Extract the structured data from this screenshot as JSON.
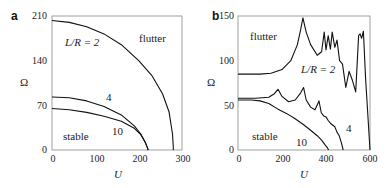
{
  "chart_data": [
    {
      "panel": "a",
      "type": "line",
      "xlabel": "U",
      "ylabel": "Ω",
      "xlim": [
        0,
        300
      ],
      "ylim": [
        0,
        210
      ],
      "xticks": [
        0,
        100,
        200,
        300
      ],
      "yticks": [
        0,
        70,
        140,
        210
      ],
      "regions": [
        "flutter",
        "stable"
      ],
      "series": [
        {
          "name": "L/R = 2",
          "label": "L/R = 2",
          "x": [
            0,
            40,
            80,
            120,
            160,
            200,
            230,
            255,
            270,
            278,
            280,
            280
          ],
          "y": [
            203,
            200,
            193,
            182,
            165,
            140,
            117,
            88,
            60,
            25,
            5,
            0
          ]
        },
        {
          "name": "4",
          "label": "4",
          "x": [
            0,
            40,
            80,
            120,
            160,
            190,
            205,
            215,
            220,
            222
          ],
          "y": [
            83,
            82,
            77,
            68,
            55,
            38,
            25,
            12,
            4,
            0
          ]
        },
        {
          "name": "10",
          "label": "10",
          "x": [
            0,
            40,
            80,
            120,
            160,
            190,
            205,
            215,
            220,
            222
          ],
          "y": [
            65,
            63,
            59,
            53,
            45,
            34,
            24,
            12,
            4,
            0
          ]
        }
      ]
    },
    {
      "panel": "b",
      "type": "line",
      "xlabel": "U",
      "ylabel": "Ω",
      "xlim": [
        0,
        600
      ],
      "ylim": [
        0,
        150
      ],
      "xticks": [
        0,
        200,
        400,
        600
      ],
      "yticks": [
        0,
        50,
        100,
        150
      ],
      "regions": [
        "flutter",
        "stable"
      ],
      "series": [
        {
          "name": "L/R = 2",
          "label": "L/R = 2",
          "x": [
            0,
            100,
            150,
            200,
            240,
            270,
            285,
            295,
            310,
            330,
            360,
            380,
            392,
            400,
            410,
            420,
            428,
            440,
            450,
            462,
            475,
            490,
            505,
            520,
            535,
            548,
            555,
            562,
            570,
            580,
            590,
            600
          ],
          "y": [
            85,
            85,
            86,
            90,
            100,
            118,
            135,
            148,
            132,
            118,
            106,
            110,
            132,
            112,
            128,
            113,
            132,
            115,
            123,
            100,
            96,
            70,
            88,
            78,
            65,
            128,
            130,
            125,
            133,
            80,
            40,
            0
          ]
        },
        {
          "name": "4",
          "label": "4",
          "x": [
            0,
            80,
            140,
            165,
            182,
            200,
            230,
            260,
            285,
            298,
            310,
            330,
            350,
            368,
            378,
            390,
            400,
            410,
            420,
            430,
            440,
            450,
            460,
            470,
            478
          ],
          "y": [
            58,
            58,
            59,
            63,
            68,
            60,
            54,
            56,
            64,
            70,
            56,
            48,
            45,
            55,
            42,
            38,
            37,
            33,
            30,
            28,
            26,
            20,
            16,
            8,
            0
          ]
        },
        {
          "name": "10",
          "label": "10",
          "x": [
            0,
            60,
            100,
            140,
            180,
            220,
            260,
            300,
            330,
            360,
            380,
            395,
            405,
            412
          ],
          "y": [
            56,
            56,
            55,
            52,
            46,
            41,
            35,
            28,
            22,
            16,
            11,
            6,
            3,
            0
          ]
        }
      ]
    }
  ],
  "panels": {
    "a": {
      "letter": "a",
      "ylabel": "Ω",
      "xlabel": "U",
      "xticks": [
        "0",
        "100",
        "200",
        "300"
      ],
      "yticks": [
        "0",
        "70",
        "140",
        "210"
      ],
      "annotations": {
        "flutter": "flutter",
        "stable": "stable",
        "lr2": "L/R = 2",
        "lr4": "4",
        "lr10": "10"
      }
    },
    "b": {
      "letter": "b",
      "ylabel": "Ω",
      "xlabel": "U",
      "xticks": [
        "0",
        "200",
        "400",
        "600"
      ],
      "yticks": [
        "0",
        "50",
        "100",
        "150"
      ],
      "annotations": {
        "flutter": "flutter",
        "stable": "stable",
        "lr2": "L/R = 2",
        "lr4": "4",
        "lr10": "10"
      }
    }
  }
}
